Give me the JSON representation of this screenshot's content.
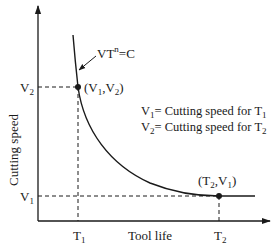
{
  "diagram": {
    "type": "tool-life-curve",
    "y_axis": {
      "label": "Cutting speed",
      "ticks": [
        {
          "main": "V",
          "sub": "2"
        },
        {
          "main": "V",
          "sub": "1"
        }
      ]
    },
    "x_axis": {
      "label": "Tool life",
      "ticks": [
        {
          "main": "T",
          "sub": "1"
        },
        {
          "main": "T",
          "sub": "2"
        }
      ]
    },
    "equation": {
      "v": "VT",
      "exp": "n",
      "rest": "=C"
    },
    "points": [
      {
        "label_open": "(V",
        "sub1": "1",
        "mid": ",V",
        "sub2": "2",
        "label_close": ")"
      },
      {
        "label_open": "(T",
        "sub1": "2",
        "mid": ",V",
        "sub2": "1",
        "label_close": ")"
      }
    ],
    "legend": [
      {
        "main": "V",
        "sub": "1",
        "text": "= Cutting speed for T",
        "tsub": "1"
      },
      {
        "main": "V",
        "sub": "2",
        "text": "= Cutting speed for T",
        "tsub": "2"
      }
    ],
    "colors": {
      "line": "#1a1a1a",
      "background": "#ffffff"
    }
  }
}
